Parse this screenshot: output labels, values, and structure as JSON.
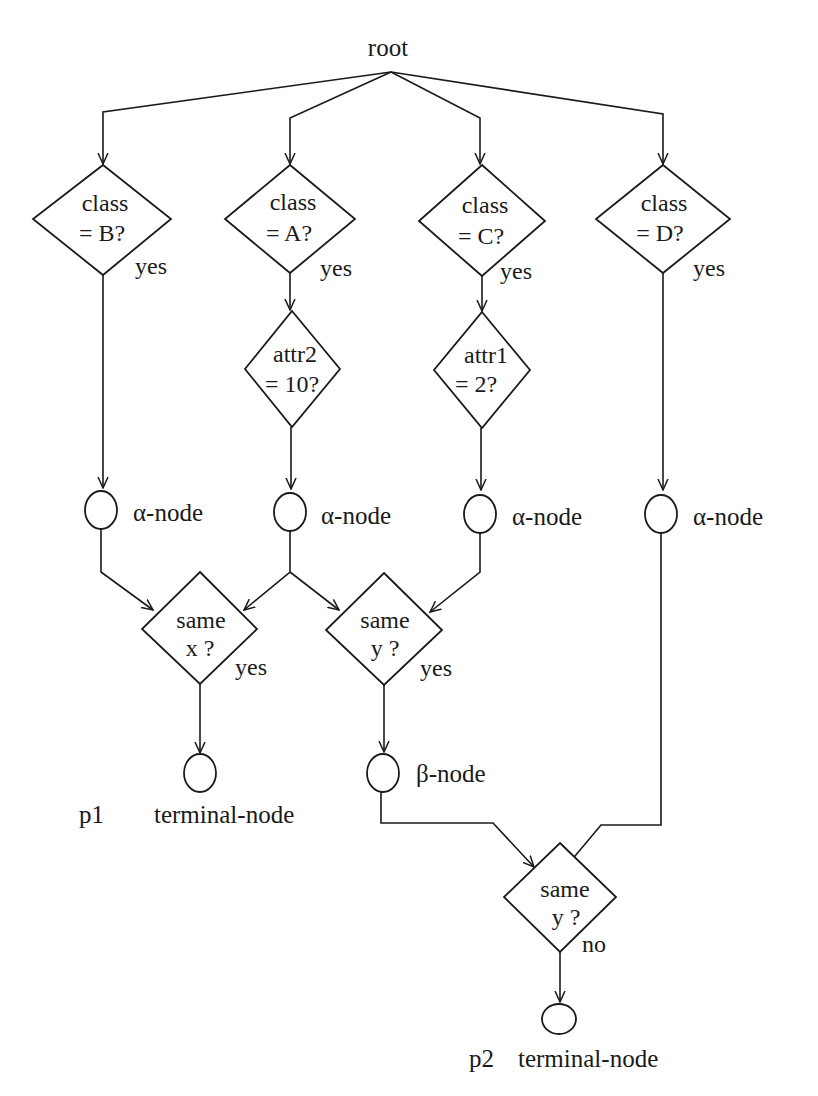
{
  "diagram": {
    "type": "rete-network",
    "root": {
      "label": "root"
    },
    "class_tests": [
      {
        "id": "class_b",
        "line1": "class",
        "line2": "= B?",
        "branch": "yes"
      },
      {
        "id": "class_a",
        "line1": "class",
        "line2": "= A?",
        "branch": "yes"
      },
      {
        "id": "class_c",
        "line1": "class",
        "line2": "= C?",
        "branch": "yes"
      },
      {
        "id": "class_d",
        "line1": "class",
        "line2": "= D?",
        "branch": "yes"
      }
    ],
    "attr_tests": [
      {
        "id": "attr2",
        "line1": "attr2",
        "line2": "= 10?"
      },
      {
        "id": "attr1",
        "line1": "attr1",
        "line2": "= 2?"
      }
    ],
    "alpha_nodes": [
      {
        "label": "α-node"
      },
      {
        "label": "α-node"
      },
      {
        "label": "α-node"
      },
      {
        "label": "α-node"
      }
    ],
    "join_tests": [
      {
        "id": "same_x",
        "line1": "same",
        "line2": "x ?",
        "branch": "yes"
      },
      {
        "id": "same_y",
        "line1": "same",
        "line2": "y ?",
        "branch": "yes"
      },
      {
        "id": "same_y2",
        "line1": "same",
        "line2": "y ?",
        "branch": "no"
      }
    ],
    "beta_node": {
      "label": "β-node"
    },
    "terminals": [
      {
        "production": "p1",
        "label": "terminal-node"
      },
      {
        "production": "p2",
        "label": "terminal-node"
      }
    ],
    "edges": [
      [
        "root",
        "class_b"
      ],
      [
        "root",
        "class_a"
      ],
      [
        "root",
        "class_c"
      ],
      [
        "root",
        "class_d"
      ],
      [
        "class_b",
        "alpha_1"
      ],
      [
        "class_a",
        "attr2"
      ],
      [
        "class_c",
        "attr1"
      ],
      [
        "class_d",
        "alpha_4"
      ],
      [
        "attr2",
        "alpha_2"
      ],
      [
        "attr1",
        "alpha_3"
      ],
      [
        "alpha_1",
        "same_x"
      ],
      [
        "alpha_2",
        "same_x"
      ],
      [
        "alpha_2",
        "same_y"
      ],
      [
        "alpha_3",
        "same_y"
      ],
      [
        "same_x",
        "p1"
      ],
      [
        "same_y",
        "beta"
      ],
      [
        "beta",
        "same_y2"
      ],
      [
        "alpha_4",
        "same_y2"
      ],
      [
        "same_y2",
        "p2"
      ]
    ]
  }
}
